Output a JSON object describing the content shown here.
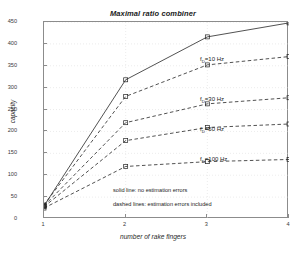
{
  "chart_data": {
    "type": "line",
    "title": "Maximal ratio combiner",
    "xlabel": "number of rake fingers",
    "ylabel": "capacity",
    "x": [
      1,
      2,
      3,
      4
    ],
    "xlim": [
      1,
      4
    ],
    "ylim": [
      0,
      450
    ],
    "xticks": [
      "1",
      "2",
      "3",
      "4"
    ],
    "yticks": [
      "50",
      "100",
      "150",
      "200",
      "250",
      "300",
      "350",
      "400",
      "450"
    ],
    "grid": true,
    "legend_position": "inline-annotations",
    "series": [
      {
        "name": "no estimation errors",
        "style": "solid",
        "marker": "square",
        "values": [
          30,
          318,
          416,
          448
        ],
        "annotation": ""
      },
      {
        "name": "fD=10 Hz",
        "style": "dashed",
        "marker": "square",
        "values": [
          32,
          280,
          352,
          371
        ],
        "annotation": "f_D=10 Hz"
      },
      {
        "name": "fD=30 Hz",
        "style": "dashed",
        "marker": "square",
        "values": [
          30,
          220,
          263,
          277
        ],
        "annotation": "f_D=30 Hz"
      },
      {
        "name": "fD=50 Hz",
        "style": "dashed",
        "marker": "square",
        "values": [
          28,
          179,
          209,
          217
        ],
        "annotation": "f_D=50 Hz"
      },
      {
        "name": "fD=100 Hz",
        "style": "dashed",
        "marker": "square",
        "values": [
          25,
          120,
          131,
          136
        ],
        "annotation": "f_D=100 Hz"
      }
    ],
    "annotations": [
      "solid line: no estimation errors",
      "dashed lines: estimation errors included"
    ],
    "colors": {
      "line": "#262626",
      "axis": "#8c8c8c",
      "grid": "#d9d9d9",
      "text": "#1a1a1a",
      "background": "#ffffff"
    }
  },
  "labels": {
    "annot_10": {
      "base": "f",
      "sub": "D",
      "rest": "=10 Hz"
    },
    "annot_30": {
      "base": "f",
      "sub": "D",
      "rest": "=30 Hz"
    },
    "annot_50": {
      "base": "f",
      "sub": "D",
      "rest": "=50 Hz"
    },
    "annot_100": {
      "base": "f",
      "sub": "D",
      "rest": "=100 Hz"
    },
    "note_solid": "solid line: no estimation errors",
    "note_dashed": "dashed lines: estimation errors included"
  }
}
